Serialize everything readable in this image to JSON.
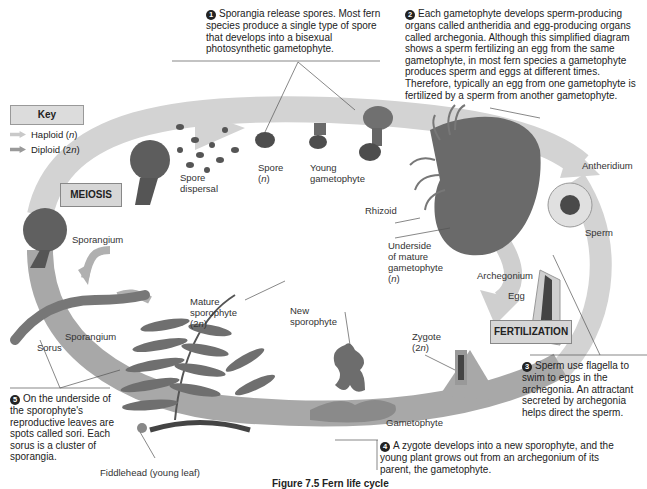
{
  "key": {
    "title": "Key",
    "items": [
      {
        "label": "Haploid (n)",
        "color": "#c9c9c9"
      },
      {
        "label": "Diploid (2n)",
        "color": "#9a9a9a"
      }
    ]
  },
  "stages": {
    "meiosis": "MEIOSIS",
    "fertilization": "FERTILIZATION"
  },
  "notes": {
    "n1": {
      "num": "1",
      "text": "Sporangia release spores. Most fern species produce a single type of spore that develops into a bisexual photosynthetic gametophyte."
    },
    "n2": {
      "num": "2",
      "text": "Each gametophyte develops sperm-producing organs called antheridia and egg-producing organs called archegonia. Although this simplified diagram shows a sperm fertilizing an egg from the same gametophyte, in most fern species a gametophyte produces sperm and eggs at different times. Therefore, typically an egg from one gametophyte is fertilized by a sperm from another gametophyte."
    },
    "n3": {
      "num": "3",
      "text": "Sperm use flagella to swim to eggs in the archegonia. An attractant secreted by archegonia helps direct the sperm."
    },
    "n4": {
      "num": "4",
      "text": "A zygote develops into a new sporophyte, and the young plant grows out from an archegonium of its parent, the gametophyte."
    },
    "n5": {
      "num": "5",
      "text": "On the underside of the sporophyte's reproductive leaves are spots called sori. Each sorus is a cluster of sporangia."
    }
  },
  "labels": {
    "spore": "Spore",
    "spore_ploidy": "(n)",
    "young_gametophyte_1": "Young",
    "young_gametophyte_2": "gametophyte",
    "spore_dispersal_1": "Spore",
    "spore_dispersal_2": "dispersal",
    "sporangium_top": "Sporangium",
    "sporangium_bottom": "Sporangium",
    "sorus": "Sorus",
    "rhizoid": "Rhizoid",
    "underside_1": "Underside",
    "underside_2": "of mature",
    "underside_3": "gametophyte",
    "underside_4": "(n)",
    "antheridium": "Antheridium",
    "sperm": "Sperm",
    "archegonium": "Archegonium",
    "egg": "Egg",
    "zygote_1": "Zygote",
    "zygote_2": "(2n)",
    "new_sporophyte_1": "New",
    "new_sporophyte_2": "sporophyte",
    "gametophyte": "Gametophyte",
    "mature_sporophyte_1": "Mature",
    "mature_sporophyte_2": "sporophyte",
    "mature_sporophyte_3": "(2n)",
    "fiddlehead": "Fiddlehead (young leaf)"
  },
  "caption": "Figure 7.5  Fern life cycle",
  "colors": {
    "haploid_band": "#d0d0d0",
    "diploid_band": "#a6a6a6",
    "organism": "#6f6f6f",
    "organism_dark": "#4a4a4a"
  }
}
